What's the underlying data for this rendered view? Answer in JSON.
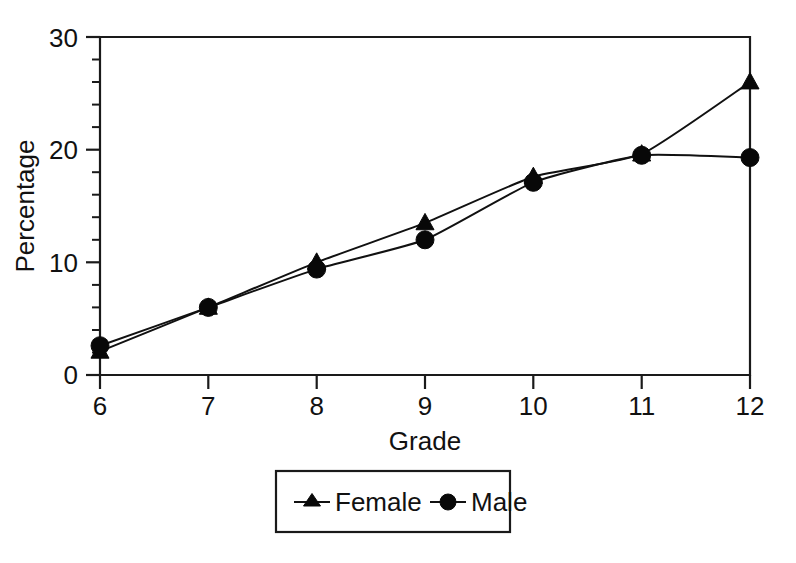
{
  "chart_data": {
    "type": "line",
    "title": "",
    "xlabel": "Grade",
    "ylabel": "Percentage",
    "x": [
      6,
      7,
      8,
      9,
      10,
      11,
      12
    ],
    "xticklabels": [
      "6",
      "7",
      "8",
      "9",
      "10",
      "11",
      "12"
    ],
    "yticklabels": [
      "0",
      "10",
      "20",
      "30"
    ],
    "yticks": [
      0,
      10,
      20,
      30
    ],
    "xlim": [
      6,
      12
    ],
    "ylim": [
      0,
      30
    ],
    "y_minor_tick_step": 2,
    "grid": false,
    "legend_position": "below-center",
    "series": [
      {
        "name": "Female",
        "marker": "triangle",
        "color": "#111111",
        "values": [
          2.1,
          6.0,
          10.0,
          13.5,
          17.6,
          19.6,
          26.0
        ]
      },
      {
        "name": "Male",
        "marker": "circle",
        "color": "#111111",
        "values": [
          2.6,
          6.0,
          9.4,
          12.0,
          17.1,
          19.5,
          19.3
        ]
      }
    ]
  },
  "axes": {
    "y_title": "Percentage",
    "x_title": "Grade",
    "y_tick_0": "0",
    "y_tick_1": "10",
    "y_tick_2": "20",
    "y_tick_3": "30",
    "x_tick_0": "6",
    "x_tick_1": "7",
    "x_tick_2": "8",
    "x_tick_3": "9",
    "x_tick_4": "10",
    "x_tick_5": "11",
    "x_tick_6": "12"
  },
  "legend": {
    "entries": [
      {
        "label": "Female",
        "marker": "triangle-icon"
      },
      {
        "label": "Male",
        "marker": "circle-icon"
      }
    ],
    "female_label": "Female",
    "male_label": "Male"
  }
}
